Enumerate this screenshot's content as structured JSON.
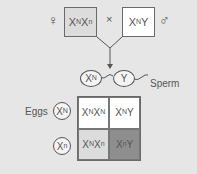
{
  "parents": {
    "female_symbol": "♀",
    "male_symbol": "♂",
    "cross_symbol": "×",
    "female": {
      "base1": "X",
      "sup1": "N",
      "base2": "X",
      "sup2": "n",
      "fill": "#dcdcdc"
    },
    "male": {
      "base1": "X",
      "sup1": "N",
      "base2": "Y",
      "fill": "#ffffff"
    }
  },
  "sperm": {
    "label": "Sperm",
    "gametes": [
      {
        "base": "X",
        "sup": "N"
      },
      {
        "base": "Y",
        "sup": ""
      }
    ]
  },
  "eggs": {
    "label": "Eggs",
    "gametes": [
      {
        "base": "X",
        "sup": "N"
      },
      {
        "base": "X",
        "sup": "n"
      }
    ]
  },
  "punnett": {
    "cells": [
      {
        "a": "X",
        "as": "N",
        "b": "X",
        "bs": "N",
        "fill": "#ffffff"
      },
      {
        "a": "X",
        "as": "N",
        "b": "Y",
        "bs": "",
        "fill": "#ffffff"
      },
      {
        "a": "X",
        "as": "N",
        "b": "X",
        "bs": "n",
        "fill": "#dcdcdc"
      },
      {
        "a": "X",
        "as": "n",
        "b": "Y",
        "bs": "",
        "fill": "#8e8e8e"
      }
    ]
  }
}
